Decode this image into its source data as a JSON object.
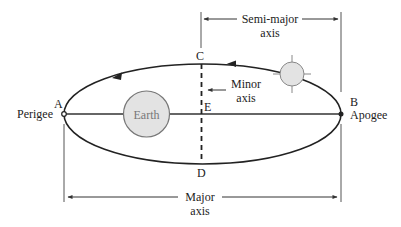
{
  "diagram": {
    "points": {
      "A": "A",
      "B": "B",
      "C": "C",
      "D": "D",
      "E": "E"
    },
    "labels": {
      "perigee": "Perigee",
      "apogee": "Apogee",
      "earth": "Earth",
      "minor_axis_line1": "Minor",
      "minor_axis_line2": "axis",
      "semi_major_line1": "Semi-major",
      "semi_major_line2": "axis",
      "major_axis_line1": "Major",
      "major_axis_line2": "axis"
    },
    "direction": "counter-clockwise",
    "colors": {
      "stroke": "#222222",
      "body_fill": "#e3e3e3",
      "body_stroke": "#777777"
    }
  }
}
